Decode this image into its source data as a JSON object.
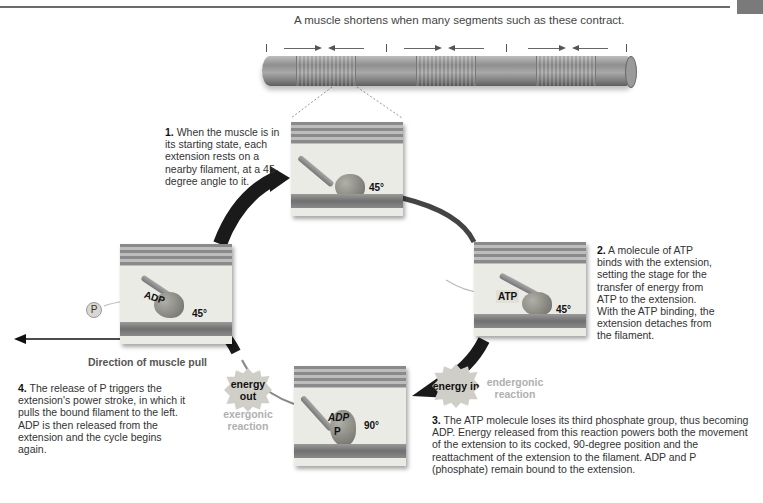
{
  "header": {
    "caption": "A muscle shortens when many segments such as these contract."
  },
  "steps": [
    {
      "num": "1.",
      "text": "When the muscle is in its starting state, each extension rests on a nearby filament, at a 45-degree angle to it."
    },
    {
      "num": "2.",
      "text": "A molecule of ATP binds with the extension, setting the stage for the transfer of energy from ATP to the extension. With the ATP binding, the extension detaches from the filament."
    },
    {
      "num": "3.",
      "text": "The ATP molecule loses its third phosphate group, thus becoming ADP. Energy released from this reaction powers both the movement of the extension to its cocked, 90-degree position and the reattachment of the extension to the filament. ADP and P (phosphate) remain bound to the extension."
    },
    {
      "num": "4.",
      "text": "The release of P triggers the extension's power stroke, in which it pulls the bound filament to the left. ADP is then released from the extension and the cycle begins again."
    }
  ],
  "panels": {
    "top": {
      "angle": "45°"
    },
    "right": {
      "angle": "45°",
      "molecule": "ATP"
    },
    "bottom": {
      "angle": "90°",
      "molecule1": "ADP",
      "molecule2": "P"
    },
    "left": {
      "angle": "45°",
      "molecule": "ADP",
      "released": "P"
    }
  },
  "labels": {
    "direction": "Direction of muscle pull",
    "energy_in": "energy in",
    "energy_out": "energy out",
    "endergonic": "endergonic reaction",
    "exergonic": "exergonic reaction"
  }
}
